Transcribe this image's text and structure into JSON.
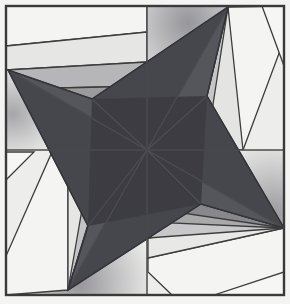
{
  "artwork": {
    "title": "Four-Point Pinwheel Star Block",
    "type": "geometric-quilt-block",
    "canvas": {
      "width": 290,
      "height": 304
    },
    "background_color": "#f2f2f0",
    "frame": {
      "x": 5,
      "y": 5,
      "width": 280,
      "height": 291,
      "stroke_color": "#3a3a3a",
      "stroke_width": 2.2,
      "fill_color": "#e9e9e6"
    },
    "center_point": {
      "x": 147,
      "y": 150
    },
    "dividers": {
      "vertical_x": 147,
      "horizontal_y": 150,
      "stroke_color": "#4a4a4a",
      "stroke_width": 1.6
    },
    "outline_color": "#3c3c3c",
    "outline_width": 1.4,
    "palette": {
      "star_dark": "#3c3c42",
      "star_mid_dark": "#55555c",
      "star_shadow": "#4a4a52",
      "band_dark_gray": "#77777c",
      "band_mid_gray": "#9a9a9d",
      "band_light_gray": "#b9b9bb",
      "band_pale": "#d4d4d4",
      "band_white": "#ececec",
      "band_offwhite": "#f4f4f2",
      "corner_glow": "#8e8e93"
    },
    "star": {
      "points": 4,
      "tips": [
        {
          "name": "tip-west",
          "x": 8,
          "y": 70
        },
        {
          "name": "tip-north",
          "x": 228,
          "y": 7
        },
        {
          "name": "tip-east",
          "x": 284,
          "y": 228
        },
        {
          "name": "tip-south",
          "x": 68,
          "y": 290
        }
      ],
      "inner_notches": [
        {
          "name": "notch-top",
          "x": 207,
          "y": 96
        },
        {
          "name": "notch-right",
          "x": 201,
          "y": 204
        },
        {
          "name": "notch-bottom",
          "x": 88,
          "y": 226
        },
        {
          "name": "notch-left",
          "x": 92,
          "y": 99
        }
      ]
    },
    "quadrants": [
      {
        "name": "top-left",
        "band_count": 5
      },
      {
        "name": "top-right",
        "band_count": 5
      },
      {
        "name": "bottom-left",
        "band_count": 5
      },
      {
        "name": "bottom-right",
        "band_count": 5
      }
    ]
  }
}
